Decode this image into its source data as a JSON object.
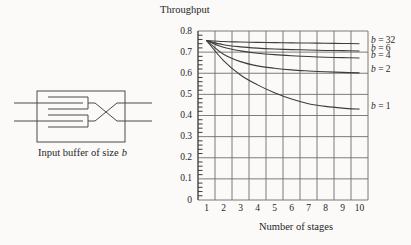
{
  "figure": {
    "background": "#fbfaf8",
    "text_color": "#1f1f1f",
    "grid_color": "#6e6e6e",
    "line_color": "#3d3d3d",
    "diagram_stroke": "#4a4a4a"
  },
  "diagram": {
    "caption": {
      "text": "Input buffer of size",
      "var": "b"
    }
  },
  "chart_data": {
    "type": "line",
    "title": "Throughput",
    "xlabel": "Number of stages",
    "ylabel": "Throughput",
    "categories": [
      1,
      2,
      3,
      4,
      5,
      6,
      7,
      8,
      9,
      10
    ],
    "xlim": [
      1,
      10
    ],
    "ylim": [
      0,
      0.8
    ],
    "y_tick_step": 0.1,
    "y_minor_tick_step": 0.02,
    "grid": true,
    "legend_position": "right-of-plot",
    "series": [
      {
        "name": "b = 32",
        "var": "b",
        "rest": " = 32",
        "values": [
          0.755,
          0.75,
          0.748,
          0.746,
          0.745,
          0.744,
          0.743,
          0.742,
          0.741,
          0.74
        ]
      },
      {
        "name": "b = 6",
        "var": "b",
        "rest": " = 6",
        "values": [
          0.755,
          0.735,
          0.725,
          0.719,
          0.715,
          0.712,
          0.71,
          0.708,
          0.707,
          0.705
        ]
      },
      {
        "name": "b = 4",
        "var": "b",
        "rest": " = 4",
        "values": [
          0.755,
          0.723,
          0.706,
          0.695,
          0.688,
          0.683,
          0.679,
          0.676,
          0.674,
          0.672
        ]
      },
      {
        "name": "b = 2",
        "var": "b",
        "rest": " = 2",
        "values": [
          0.755,
          0.69,
          0.655,
          0.635,
          0.624,
          0.616,
          0.611,
          0.607,
          0.604,
          0.602
        ]
      },
      {
        "name": "b = 1",
        "var": "b",
        "rest": " = 1",
        "values": [
          0.755,
          0.66,
          0.592,
          0.545,
          0.508,
          0.478,
          0.456,
          0.443,
          0.435,
          0.43
        ]
      }
    ]
  }
}
